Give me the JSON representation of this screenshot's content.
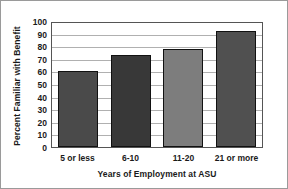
{
  "chart_data": {
    "type": "bar",
    "title": "",
    "xlabel": "Years of Employment at ASU",
    "ylabel": "Percent Familiar with Benefit",
    "categories": [
      "5 or less",
      "6-10",
      "11-20",
      "21 or more"
    ],
    "values": [
      60,
      73,
      78,
      92
    ],
    "series": [
      {
        "name": "Percent Familiar with Benefit",
        "values": [
          60,
          73,
          78,
          92
        ]
      }
    ],
    "ylim": [
      0,
      100
    ],
    "yticks": [
      0,
      10,
      20,
      30,
      40,
      50,
      60,
      70,
      80,
      90,
      100
    ],
    "ytick_labels": [
      "0",
      "10",
      "20",
      "30",
      "40",
      "50",
      "60",
      "70",
      "80",
      "90",
      "100"
    ],
    "grid": "horizontal",
    "legend": "none",
    "bar_colors": [
      "#4a4a4a",
      "#383838",
      "#7d7d7d",
      "#505050"
    ],
    "bar_edge_color": "#111111",
    "gridline_color": "#b0b0b0",
    "plot_border_color": "#555555",
    "background_color": "#ffffff",
    "text_color": "#1a1a1a"
  }
}
